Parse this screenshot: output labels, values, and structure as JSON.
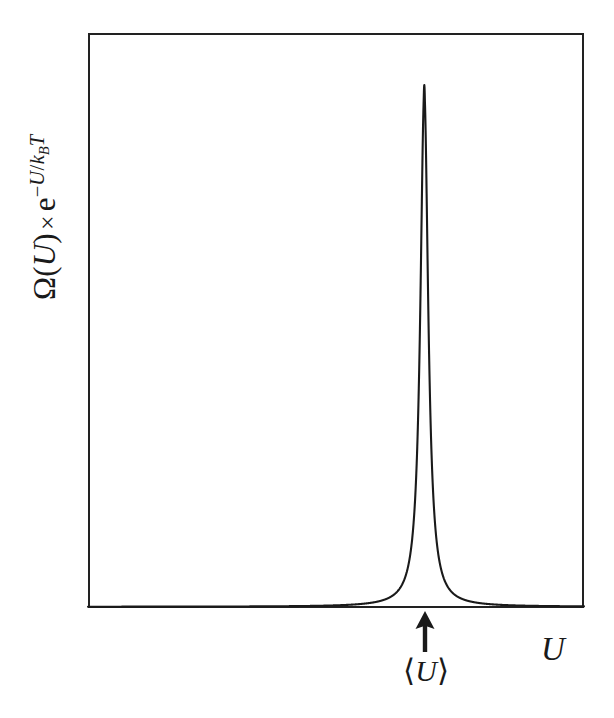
{
  "figure": {
    "background_color": "#ffffff",
    "frame_color": "#222222",
    "curve_color": "#1a1a1a"
  },
  "axes": {
    "y_label": {
      "omega": "Ω",
      "open_paren": "(",
      "variable": "U",
      "close_paren": ")",
      "times": "×",
      "exp_base": "e",
      "exp_minus": "−",
      "exp_numerator": "U",
      "exp_slash": "/",
      "exp_k": "k",
      "exp_k_sub": "B",
      "exp_T": "T",
      "full_text": "Ω(U) × e^(−U/k_BT)"
    },
    "x_label": "U"
  },
  "annotations": {
    "mean_marker": {
      "icon": "up-arrow-icon",
      "label_open": "⟨",
      "label_variable": "U",
      "label_close": "⟩",
      "full_text": "⟨U⟩"
    }
  },
  "chart_data": {
    "type": "line",
    "title": "",
    "subtitle": "",
    "xlabel": "U",
    "ylabel": "Ω(U) × e^(−U/k_BT)",
    "grid": false,
    "legend": null,
    "xlim": [
      0,
      1
    ],
    "ylim": [
      0,
      1
    ],
    "axis_ticks": {
      "x": [],
      "y": []
    },
    "peak": {
      "center_x": 0.678,
      "center_y": 1.0,
      "relative_fwhm": 0.0115,
      "baseline_y": 0.0
    },
    "x": [
      0.0,
      0.05,
      0.1,
      0.15,
      0.2,
      0.25,
      0.3,
      0.35,
      0.4,
      0.45,
      0.5,
      0.54,
      0.57,
      0.6,
      0.62,
      0.635,
      0.645,
      0.652,
      0.658,
      0.662,
      0.666,
      0.669,
      0.672,
      0.674,
      0.676,
      0.678,
      0.68,
      0.682,
      0.684,
      0.687,
      0.69,
      0.694,
      0.7,
      0.707,
      0.715,
      0.725,
      0.74,
      0.76,
      0.79,
      0.83,
      0.88,
      0.93,
      1.0
    ],
    "y": [
      0.0,
      0.0,
      0.0,
      0.0,
      0.0,
      0.0,
      0.0,
      0.0,
      0.0,
      0.0,
      0.0,
      0.0,
      0.0,
      0.001,
      0.002,
      0.005,
      0.01,
      0.022,
      0.055,
      0.098,
      0.205,
      0.36,
      0.57,
      0.74,
      0.9,
      1.0,
      0.9,
      0.74,
      0.57,
      0.33,
      0.18,
      0.075,
      0.022,
      0.008,
      0.003,
      0.001,
      0.0,
      0.0,
      0.0,
      0.0,
      0.0,
      0.0,
      0.0
    ],
    "mean_marker_x": 0.68
  }
}
